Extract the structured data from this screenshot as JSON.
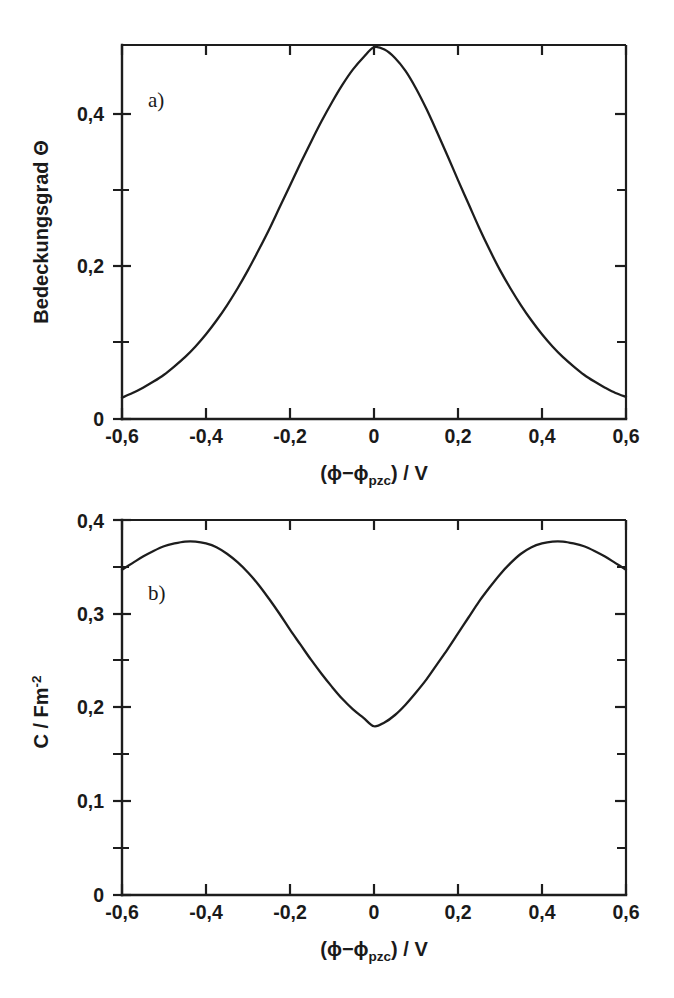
{
  "figure": {
    "background": "#ffffff",
    "ink_color": "#1d1d1d"
  },
  "chart_data": [
    {
      "id": "panel-a",
      "type": "line",
      "panel_tag": "a)",
      "title": "",
      "xlabel": "(ϕ−ϕpzc) / V",
      "xlabel_parts": {
        "prefix": "(ϕ−ϕ",
        "subscript": "pzc",
        "suffix": ") / V"
      },
      "ylabel": "Bedeckungsgrad Θ",
      "ylabel_parts": {
        "text": "Bedeckungsgrad Θ"
      },
      "xlim": [
        -0.6,
        0.6
      ],
      "ylim": [
        0,
        0.49
      ],
      "xticks": [
        -0.6,
        -0.4,
        -0.2,
        0,
        0.2,
        0.4,
        0.6
      ],
      "xticklabels": [
        "-0,6",
        "-0,4",
        "-0,2",
        "0",
        "0,2",
        "0,4",
        "0,6"
      ],
      "xminorticks": [
        -0.5,
        -0.3,
        -0.1,
        0.1,
        0.3,
        0.5
      ],
      "yticks": [
        0,
        0.2,
        0.4
      ],
      "yticklabels": [
        "0",
        "0,2",
        "0,4"
      ],
      "yminorticks": [
        0.1,
        0.3
      ],
      "grid": false,
      "legend": "none",
      "series": [
        {
          "name": "Bedeckungsgrad",
          "x": [
            -0.6,
            -0.575,
            -0.55,
            -0.525,
            -0.5,
            -0.475,
            -0.45,
            -0.425,
            -0.4,
            -0.375,
            -0.35,
            -0.325,
            -0.3,
            -0.275,
            -0.25,
            -0.225,
            -0.2,
            -0.175,
            -0.15,
            -0.125,
            -0.1,
            -0.075,
            -0.05,
            -0.025,
            0.0,
            0.025,
            0.05,
            0.075,
            0.1,
            0.125,
            0.15,
            0.175,
            0.2,
            0.225,
            0.25,
            0.275,
            0.3,
            0.325,
            0.35,
            0.375,
            0.4,
            0.425,
            0.45,
            0.475,
            0.5,
            0.525,
            0.55,
            0.575,
            0.6
          ],
          "y": [
            0.028,
            0.034,
            0.041,
            0.049,
            0.058,
            0.069,
            0.081,
            0.095,
            0.111,
            0.129,
            0.149,
            0.171,
            0.195,
            0.221,
            0.248,
            0.277,
            0.306,
            0.335,
            0.363,
            0.39,
            0.415,
            0.438,
            0.458,
            0.474,
            0.487,
            0.484,
            0.473,
            0.456,
            0.433,
            0.406,
            0.376,
            0.345,
            0.313,
            0.282,
            0.251,
            0.222,
            0.195,
            0.171,
            0.149,
            0.129,
            0.111,
            0.095,
            0.081,
            0.069,
            0.058,
            0.049,
            0.041,
            0.034,
            0.029
          ]
        }
      ]
    },
    {
      "id": "panel-b",
      "type": "line",
      "panel_tag": "b)",
      "title": "",
      "xlabel": "(ϕ−ϕpzc) / V",
      "xlabel_parts": {
        "prefix": "(ϕ−ϕ",
        "subscript": "pzc",
        "suffix": ") / V"
      },
      "ylabel": "C / Fm-2",
      "ylabel_parts": {
        "prefix": "C / Fm",
        "superscript": "-2"
      },
      "xlim": [
        -0.6,
        0.6
      ],
      "ylim": [
        0,
        0.4
      ],
      "xticks": [
        -0.6,
        -0.4,
        -0.2,
        0,
        0.2,
        0.4,
        0.6
      ],
      "xticklabels": [
        "-0,6",
        "-0,4",
        "-0,2",
        "0",
        "0,2",
        "0,4",
        "0,6"
      ],
      "xminorticks": [
        -0.5,
        -0.3,
        -0.1,
        0.1,
        0.3,
        0.5
      ],
      "yticks": [
        0,
        0.1,
        0.2,
        0.3,
        0.4
      ],
      "yticklabels": [
        "0",
        "0,1",
        "0,2",
        "0,3",
        "0,4"
      ],
      "yminorticks": [
        0.05,
        0.15,
        0.25,
        0.35
      ],
      "grid": false,
      "legend": "none",
      "series": [
        {
          "name": "Kapazität",
          "x": [
            -0.6,
            -0.575,
            -0.55,
            -0.525,
            -0.5,
            -0.475,
            -0.45,
            -0.425,
            -0.4,
            -0.375,
            -0.35,
            -0.325,
            -0.3,
            -0.275,
            -0.25,
            -0.225,
            -0.2,
            -0.175,
            -0.15,
            -0.125,
            -0.1,
            -0.075,
            -0.05,
            -0.025,
            0.0,
            0.025,
            0.05,
            0.075,
            0.1,
            0.125,
            0.15,
            0.175,
            0.2,
            0.225,
            0.25,
            0.275,
            0.3,
            0.325,
            0.35,
            0.375,
            0.4,
            0.425,
            0.45,
            0.475,
            0.5,
            0.525,
            0.55,
            0.575,
            0.6
          ],
          "y": [
            0.347,
            0.354,
            0.361,
            0.367,
            0.372,
            0.375,
            0.377,
            0.377,
            0.375,
            0.371,
            0.364,
            0.355,
            0.344,
            0.331,
            0.316,
            0.3,
            0.283,
            0.267,
            0.251,
            0.236,
            0.222,
            0.209,
            0.198,
            0.189,
            0.18,
            0.184,
            0.192,
            0.203,
            0.216,
            0.23,
            0.246,
            0.262,
            0.279,
            0.296,
            0.313,
            0.328,
            0.342,
            0.354,
            0.364,
            0.371,
            0.375,
            0.377,
            0.377,
            0.375,
            0.372,
            0.367,
            0.361,
            0.354,
            0.347
          ]
        }
      ]
    }
  ]
}
